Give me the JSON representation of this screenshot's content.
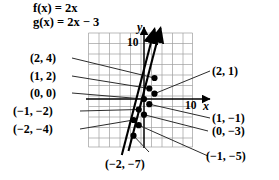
{
  "figure": {
    "type": "coordinate-plane-diagram",
    "functions": [
      {
        "id": "f",
        "text": "f(x) = 2x",
        "rule": "2x"
      },
      {
        "id": "g",
        "text": "g(x) = 2x − 3",
        "rule": "2x - 3"
      }
    ],
    "axes": {
      "x_label": "x",
      "y_label": "y",
      "x_tick_label": "10",
      "y_tick_label": "10",
      "grid": true,
      "x_range": [
        -10,
        10
      ],
      "y_range": [
        -10,
        10
      ],
      "tick_step": 2,
      "origin_px": {
        "x": 144,
        "y": 99
      },
      "unit_px": 5.25
    },
    "left_labels": [
      {
        "text": "(2, 4)",
        "x": 2,
        "y": 4,
        "curve": "f"
      },
      {
        "text": "(1, 2)",
        "x": 1,
        "y": 2,
        "curve": "f"
      },
      {
        "text": "(0, 0)",
        "x": 0,
        "y": 0,
        "curve": "f"
      },
      {
        "text": "(−1, −2)",
        "x": -1,
        "y": -2,
        "curve": "f"
      },
      {
        "text": "(−2, −4)",
        "x": -2,
        "y": -4,
        "curve": "f"
      }
    ],
    "right_labels": [
      {
        "text": "(2, 1)",
        "x": 2,
        "y": 1,
        "curve": "g"
      },
      {
        "text": "(1, −1)",
        "x": 1,
        "y": -1,
        "curve": "g"
      },
      {
        "text": "(0, −3)",
        "x": 0,
        "y": -3,
        "curve": "g"
      },
      {
        "text": "(−1, −5)",
        "x": -1,
        "y": -5,
        "curve": "g"
      }
    ],
    "bottom_labels": [
      {
        "text": "(−2, −7)",
        "x": -2,
        "y": -7,
        "curve": "g"
      }
    ],
    "colors": {
      "ink": "#000000",
      "grid": "#9a9a9a",
      "axis": "#000000"
    }
  }
}
